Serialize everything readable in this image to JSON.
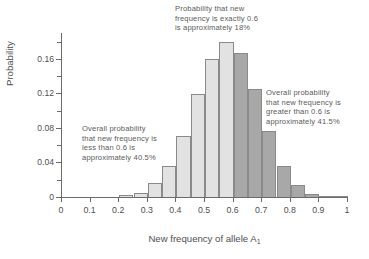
{
  "chart_data": {
    "type": "bar",
    "title": "",
    "xlabel": "New frequency of allele A",
    "xlabel_subscript": "1",
    "ylabel": "Probability",
    "xlim": [
      0,
      1
    ],
    "ylim": [
      0,
      0.19
    ],
    "grid": false,
    "legend": "none",
    "x_tick_labels": [
      "0",
      "0.1",
      "0.2",
      "0.3",
      "0.4",
      "0.5",
      "0.6",
      "0.7",
      "0.8",
      "0.9",
      "1"
    ],
    "x_tick_values": [
      0,
      0.1,
      0.2,
      0.3,
      0.4,
      0.5,
      0.6,
      0.7,
      0.8,
      0.9,
      1
    ],
    "y_tick_labels": [
      "0",
      "0.04",
      "0.08",
      "0.12",
      "0.16"
    ],
    "y_tick_values": [
      0,
      0.04,
      0.08,
      0.12,
      0.16
    ],
    "bin_width": 0.05,
    "categories": [
      "0.20",
      "0.25",
      "0.30",
      "0.35",
      "0.40",
      "0.45",
      "0.50",
      "0.55",
      "0.60",
      "0.65",
      "0.70",
      "0.75",
      "0.80",
      "0.85",
      "0.90",
      "0.95"
    ],
    "bins": [
      {
        "x": 0.2,
        "value": 0.002,
        "shade": "light"
      },
      {
        "x": 0.25,
        "value": 0.005,
        "shade": "light"
      },
      {
        "x": 0.3,
        "value": 0.016,
        "shade": "light"
      },
      {
        "x": 0.35,
        "value": 0.036,
        "shade": "light"
      },
      {
        "x": 0.4,
        "value": 0.071,
        "shade": "light"
      },
      {
        "x": 0.45,
        "value": 0.119,
        "shade": "light"
      },
      {
        "x": 0.5,
        "value": 0.16,
        "shade": "light"
      },
      {
        "x": 0.55,
        "value": 0.18,
        "shade": "light"
      },
      {
        "x": 0.6,
        "value": 0.167,
        "shade": "dark"
      },
      {
        "x": 0.65,
        "value": 0.125,
        "shade": "dark"
      },
      {
        "x": 0.7,
        "value": 0.076,
        "shade": "dark"
      },
      {
        "x": 0.75,
        "value": 0.036,
        "shade": "dark"
      },
      {
        "x": 0.8,
        "value": 0.014,
        "shade": "dark"
      },
      {
        "x": 0.85,
        "value": 0.004,
        "shade": "dark"
      },
      {
        "x": 0.9,
        "value": 0.001,
        "shade": "dark"
      },
      {
        "x": 0.95,
        "value": 0.0,
        "shade": "dark"
      }
    ],
    "values": [
      0.002,
      0.005,
      0.016,
      0.036,
      0.071,
      0.119,
      0.16,
      0.18,
      0.167,
      0.125,
      0.076,
      0.036,
      0.014,
      0.004,
      0.001,
      0.0
    ],
    "colors": {
      "light_bar": "#e2e2e2",
      "dark_bar": "#a8a8a8",
      "bar_outline": "#8a8a8a",
      "axis": "#6b6b6b",
      "text": "#4f4f4f"
    },
    "annotations": [
      {
        "id": "top",
        "text": "Probability that new\nfrequency is exactly 0.6\nis approximately 18%"
      },
      {
        "id": "left",
        "text": "Overall probability\nthat new frequency is\nless than 0.6 is\napproximately 40.5%"
      },
      {
        "id": "right",
        "text": "Overall probability\nthat new frequency is\ngreater than 0.6 is\napproximately 41.5%"
      }
    ]
  }
}
